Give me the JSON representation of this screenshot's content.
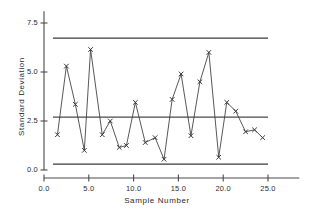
{
  "chart_data": {
    "type": "line",
    "title": "",
    "subtitle": "",
    "xlabel": "Sample  Number",
    "ylabel": "Standard  Deviation",
    "xlim": [
      0.0,
      28.5
    ],
    "ylim": [
      0.0,
      8.1
    ],
    "grid": false,
    "legend": "none",
    "x_ticks": [
      "0.0",
      "5.0",
      "10.0",
      "15.0",
      "20.0",
      "25.0"
    ],
    "x_tick_values": [
      0.0,
      5.0,
      10.0,
      15.0,
      20.0,
      25.0
    ],
    "y_ticks": [
      "0.0",
      "2.5",
      "5.0",
      "7.5"
    ],
    "y_tick_values": [
      0.0,
      2.5,
      5.0,
      7.5
    ],
    "marker": "x",
    "series": [
      {
        "name": "Standard Deviation",
        "color": "#3a3a3a",
        "x": [
          1.5,
          2.5,
          3.5,
          4.5,
          5.2,
          6.5,
          7.4,
          8.4,
          9.2,
          10.2,
          11.3,
          12.4,
          13.4,
          14.3,
          15.3,
          16.4,
          17.4,
          18.4,
          19.5,
          20.4,
          21.4,
          22.5,
          23.5,
          24.4
        ],
        "values": [
          1.8,
          5.3,
          3.35,
          1.0,
          6.15,
          1.8,
          2.5,
          1.15,
          1.25,
          3.45,
          1.4,
          1.65,
          0.55,
          3.6,
          4.9,
          1.75,
          4.5,
          6.0,
          0.65,
          3.45,
          3.0,
          1.95,
          2.05,
          1.65
        ]
      }
    ],
    "reference_lines": [
      {
        "name": "upper-control-limit",
        "value": 6.73,
        "color": "#3a3a3a",
        "x_start": 1.0,
        "x_end": 25.0
      },
      {
        "name": "center-line",
        "value": 2.7,
        "color": "#4a4a4a",
        "x_start": 1.0,
        "x_end": 25.0
      },
      {
        "name": "lower-control-limit",
        "value": 0.3,
        "color": "#3a3a3a",
        "x_start": 1.0,
        "x_end": 25.0
      }
    ]
  }
}
